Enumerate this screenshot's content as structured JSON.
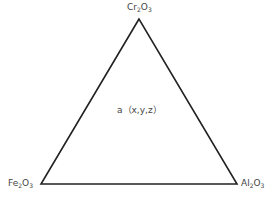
{
  "diagram": {
    "type": "ternary-triangle",
    "vertices": {
      "top": {
        "base1": "Cr",
        "sub1": "2",
        "base2": "O",
        "sub2": "3"
      },
      "bottom_left": {
        "base1": "Fe",
        "sub1": "2",
        "base2": "O",
        "sub2": "3"
      },
      "bottom_right": {
        "base1": "Al",
        "sub1": "2",
        "base2": "O",
        "sub2": "3"
      }
    },
    "point_label": "a（x,y,z）",
    "line_color": "#222222"
  }
}
